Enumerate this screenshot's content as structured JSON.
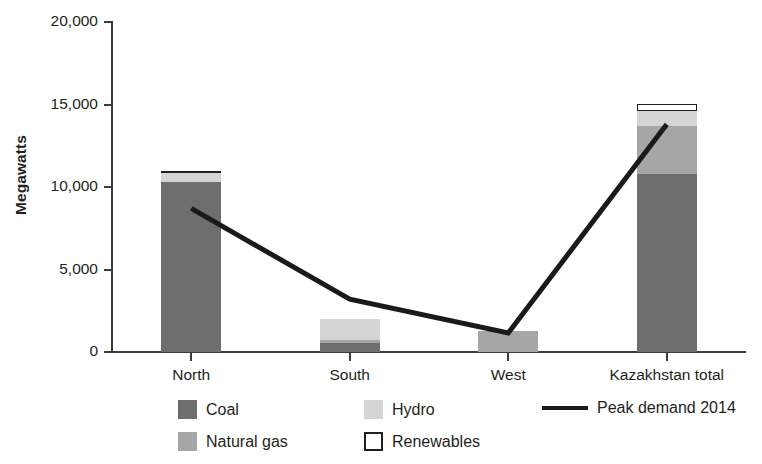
{
  "chart_data": {
    "type": "bar",
    "subtype": "stacked-bar-with-line",
    "title": "",
    "xlabel": "",
    "ylabel": "Megawatts",
    "ylim": [
      0,
      20000
    ],
    "yticks": [
      0,
      5000,
      10000,
      15000,
      20000
    ],
    "ytick_labels": [
      "0",
      "5,000",
      "10,000",
      "15,000",
      "20,000"
    ],
    "grid": false,
    "legend_position": "bottom",
    "categories": [
      "North",
      "South",
      "West",
      "Kazakhstan total"
    ],
    "series": [
      {
        "name": "Coal",
        "type": "bar",
        "color": "#6e6e6e",
        "values": [
          10300,
          550,
          0,
          10800
        ]
      },
      {
        "name": "Natural gas",
        "type": "bar",
        "color": "#a6a6a6",
        "values": [
          0,
          200,
          1250,
          2900
        ]
      },
      {
        "name": "Hydro",
        "type": "bar",
        "color": "#d5d5d5",
        "values": [
          550,
          1250,
          0,
          900
        ]
      },
      {
        "name": "Renewables",
        "type": "bar",
        "color": "#ffffff",
        "values": [
          150,
          0,
          0,
          450
        ]
      },
      {
        "name": "Peak demand 2014",
        "type": "line",
        "color": "#1a1a1a",
        "values": [
          8700,
          3200,
          1150,
          13800
        ]
      }
    ],
    "totals": [
      11000,
      2000,
      1250,
      15050
    ]
  },
  "axes": {
    "y_title": "Megawatts",
    "y_ticks": [
      {
        "label": "20,000",
        "value": 20000
      },
      {
        "label": "15,000",
        "value": 15000
      },
      {
        "label": "10,000",
        "value": 10000
      },
      {
        "label": "5,000",
        "value": 5000
      },
      {
        "label": "0",
        "value": 0
      }
    ],
    "x_ticks": [
      {
        "label": "North"
      },
      {
        "label": "South"
      },
      {
        "label": "West"
      },
      {
        "label": "Kazakhstan total"
      }
    ]
  },
  "legend": {
    "coal": {
      "label": "Coal",
      "color": "#6e6e6e"
    },
    "natural_gas": {
      "label": "Natural gas",
      "color": "#a6a6a6"
    },
    "hydro": {
      "label": "Hydro",
      "color": "#d5d5d5"
    },
    "renewables": {
      "label": "Renewables",
      "color": "#ffffff"
    },
    "peak_demand": {
      "label": "Peak demand 2014",
      "color": "#1a1a1a"
    }
  }
}
